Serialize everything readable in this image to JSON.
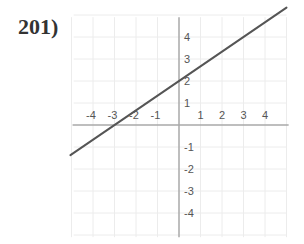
{
  "problem": {
    "number_label": "201)"
  },
  "chart_data": {
    "type": "line",
    "title": "",
    "xlabel": "",
    "ylabel": "",
    "xlim": [
      -5,
      5
    ],
    "ylim": [
      -5,
      5
    ],
    "grid": true,
    "x_tick_labels": [
      "-4",
      "-3",
      "-2",
      "-1",
      "1",
      "2",
      "3",
      "4"
    ],
    "y_tick_labels": [
      "4",
      "3",
      "2",
      "1",
      "-1",
      "-2",
      "-3",
      "-4"
    ],
    "series": [
      {
        "name": "line",
        "equation": "y = (2/3)x + 2",
        "slope": 0.6667,
        "y_intercept": 2,
        "x_intercept": -3,
        "x": [
          -5,
          -3,
          0,
          3,
          5
        ],
        "y": [
          -1.33,
          0,
          2,
          4,
          5.33
        ]
      }
    ]
  },
  "colors": {
    "axis": "#a8a8a8",
    "grid": "#ececec",
    "line": "#555555",
    "text": "#555555"
  }
}
